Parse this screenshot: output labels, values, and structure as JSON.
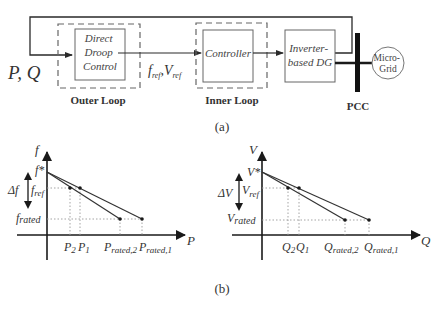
{
  "figure_a": {
    "caption": "(a)",
    "input_label": "P, Q",
    "outer_loop": {
      "label": "Outer Loop",
      "block_lines": [
        "Direct",
        "Droop",
        "Control"
      ]
    },
    "signal_label": {
      "f": "f",
      "f_sub": "ref",
      "sep": ",",
      "V": "V",
      "V_sub": "ref"
    },
    "inner_loop": {
      "label": "Inner Loop",
      "block_label": "Controller"
    },
    "inverter_block_lines": [
      "Inverter-",
      "based DG"
    ],
    "pcc_label": "PCC",
    "grid_lines": [
      "Micro-",
      "Grid"
    ]
  },
  "figure_b": {
    "caption": "(b)",
    "left_plot": {
      "y_axis": "f",
      "x_axis": "P",
      "y_star": "f*",
      "delta": "Δf",
      "y_ref": "f",
      "y_ref_sub": "ref",
      "y_rated": "f",
      "y_rated_sub": "rated",
      "x_ticks": [
        {
          "main": "P",
          "sub": "2"
        },
        {
          "main": "P",
          "sub": "1"
        },
        {
          "main": "P",
          "sub": "rated,2"
        },
        {
          "main": "P",
          "sub": "rated,1"
        }
      ]
    },
    "right_plot": {
      "y_axis": "V",
      "x_axis": "Q",
      "y_star": "V*",
      "delta": "ΔV",
      "y_ref": "V",
      "y_ref_sub": "ref",
      "y_rated": "V",
      "y_rated_sub": "rated",
      "x_ticks": [
        {
          "main": "Q",
          "sub": "2"
        },
        {
          "main": "Q",
          "sub": "1"
        },
        {
          "main": "Q",
          "sub": "rated,2"
        },
        {
          "main": "Q",
          "sub": "rated,1"
        }
      ]
    }
  },
  "colors": {
    "line": "#2a2a2a",
    "box_border": "#555555",
    "dashed": "#666666",
    "dotted": "#9a9a9a",
    "text": "#333333"
  }
}
